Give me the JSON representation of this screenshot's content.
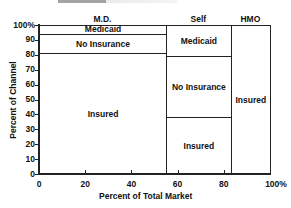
{
  "chart_data": {
    "type": "mosaic",
    "title": "",
    "xlabel": "Percent of Total Market",
    "ylabel": "Percent of Channel",
    "x_ticks": [
      "0",
      "20",
      "40",
      "60",
      "80",
      "100%"
    ],
    "y_ticks": [
      "0",
      "10",
      "20",
      "30",
      "40",
      "50",
      "60",
      "70",
      "80",
      "90",
      "100%"
    ],
    "xlim": [
      0,
      100
    ],
    "ylim": [
      0,
      100
    ],
    "columns": [
      {
        "name": "M.D.",
        "x_start": 0,
        "x_end": 55,
        "segments": [
          {
            "label": "Insured",
            "y_start": 0,
            "y_end": 81
          },
          {
            "label": "No Insurance",
            "y_start": 81,
            "y_end": 94
          },
          {
            "label": "Medicaid",
            "y_start": 94,
            "y_end": 100
          }
        ]
      },
      {
        "name": "Self",
        "x_start": 55,
        "x_end": 83,
        "segments": [
          {
            "label": "Insured",
            "y_start": 0,
            "y_end": 38
          },
          {
            "label": "No Insurance",
            "y_start": 38,
            "y_end": 79
          },
          {
            "label": "Medicaid",
            "y_start": 79,
            "y_end": 100
          }
        ]
      },
      {
        "name": "HMO",
        "x_start": 83,
        "x_end": 100,
        "segments": [
          {
            "label": "Insured",
            "y_start": 0,
            "y_end": 100
          }
        ]
      }
    ]
  }
}
